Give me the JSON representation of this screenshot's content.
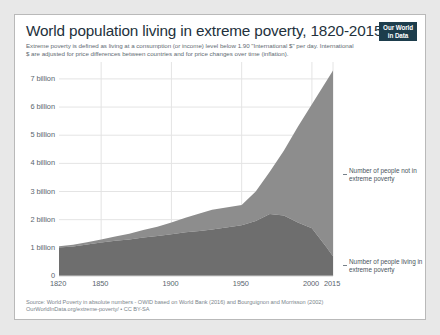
{
  "header": {
    "title": "World population living in extreme poverty, 1820-2015",
    "subtitle_line1": "Extreme poverty is defined as living at a consumption (or income) level below 1.90 \"International $\" per day.",
    "subtitle_line2": "International $ are adjusted for price differences between countries and for price changes over time (inflation)."
  },
  "logo": {
    "line1": "Our World",
    "line2": "in Data"
  },
  "footer": {
    "line1": "Source: World Poverty in absolute numbers - OWID based on World Bank (2016) and Bourguignon and Morrisson (2002)",
    "line2": "OurWorldInData.org/extreme-poverty/ • CC BY-SA"
  },
  "annotations": {
    "upper": "Number of people not in extreme poverty",
    "lower": "Number of people living in extreme poverty"
  },
  "colors": {
    "page_background": "#e8e8e8",
    "card_background": "#ffffff",
    "card_border": "#b9b9b9",
    "series_not_in_poverty": "#8d8d8d",
    "series_in_poverty": "#6e6e6e",
    "gridline": "#e4e4e4",
    "axis_line": "#cfcfcf",
    "title_text": "#23313c",
    "subtitle_text": "#5f6b73",
    "tick_text": "#59656e",
    "footer_text": "#7b858c",
    "logo_background": "#1d3d4c",
    "logo_text": "#ffffff"
  },
  "chart_data": {
    "type": "area",
    "stacked": true,
    "title": "World population living in extreme poverty, 1820-2015",
    "xlabel": "",
    "ylabel": "",
    "xlim": [
      1820,
      2015
    ],
    "ylim": [
      0,
      7600000000
    ],
    "grid": true,
    "legend_position": "right-annotations",
    "ytick_values": [
      0,
      1000000000,
      2000000000,
      3000000000,
      4000000000,
      5000000000,
      6000000000,
      7000000000
    ],
    "ytick_labels": [
      "0",
      "1 billion",
      "2 billion",
      "3 billion",
      "4 billion",
      "5 billion",
      "6 billion",
      "7 billion"
    ],
    "xtick_values": [
      1820,
      1850,
      1900,
      1950,
      2000,
      2015
    ],
    "xtick_labels": [
      "1820",
      "1850",
      "1900",
      "1950",
      "2000",
      "2015"
    ],
    "x": [
      1820,
      1830,
      1840,
      1850,
      1860,
      1870,
      1880,
      1890,
      1900,
      1910,
      1920,
      1929,
      1950,
      1960,
      1970,
      1980,
      1990,
      2000,
      2010,
      2015
    ],
    "series": [
      {
        "name": "Number of people living in extreme poverty",
        "color": "#6e6e6e",
        "units": "people",
        "values": [
          1010000000,
          1050000000,
          1120000000,
          1190000000,
          1250000000,
          1300000000,
          1370000000,
          1420000000,
          1480000000,
          1550000000,
          1600000000,
          1650000000,
          1800000000,
          1950000000,
          2200000000,
          2150000000,
          1900000000,
          1700000000,
          1050000000,
          700000000
        ]
      },
      {
        "name": "Number of people not in extreme poverty",
        "color": "#8d8d8d",
        "units": "people",
        "values": [
          45000000,
          60000000,
          80000000,
          110000000,
          150000000,
          200000000,
          260000000,
          330000000,
          420000000,
          520000000,
          620000000,
          700000000,
          720000000,
          1050000000,
          1500000000,
          2300000000,
          3400000000,
          4400000000,
          5850000000,
          6600000000
        ]
      }
    ],
    "totals": [
      1055000000,
      1110000000,
      1200000000,
      1300000000,
      1400000000,
      1500000000,
      1630000000,
      1750000000,
      1900000000,
      2070000000,
      2220000000,
      2350000000,
      2520000000,
      3000000000,
      3700000000,
      4450000000,
      5300000000,
      6100000000,
      6900000000,
      7300000000
    ],
    "notes": [
      "Extreme poverty defined as living below 1.90 International $ per day.",
      "Source: World Bank (2016); Bourguignon and Morrisson (2002)."
    ]
  }
}
